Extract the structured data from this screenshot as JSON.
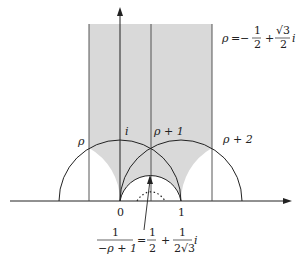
{
  "diagram": {
    "labels": {
      "rho": "ρ",
      "i": "i",
      "rho_plus_1": "ρ + 1",
      "rho_plus_2": "ρ + 2",
      "zero": "0",
      "one": "1"
    },
    "rho_definition": {
      "lhs": "ρ",
      "eq": "=",
      "minus": "−",
      "frac1_num": "1",
      "frac1_den": "2",
      "plus": "+",
      "frac2_num": "√3",
      "frac2_den": "2",
      "suffix": "i"
    },
    "annotation": {
      "lhs_num": "1",
      "lhs_den": "−ρ + 1",
      "eq": "=",
      "frac1_num": "1",
      "frac1_den": "2",
      "plus": "+",
      "frac2_num": "1",
      "frac2_den": "2√3",
      "suffix": "i"
    },
    "colors": {
      "shade": "#d9d9d9",
      "line": "#222222"
    }
  }
}
